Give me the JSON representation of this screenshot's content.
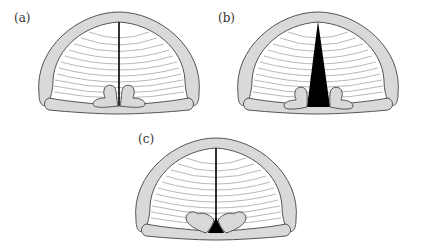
{
  "figure": {
    "panels": [
      {
        "id": "a",
        "label": "(a)",
        "description": "Glottis closed: vocal folds adducted, thin line at midline, arytenoids together"
      },
      {
        "id": "b",
        "label": "(b)",
        "description": "Glottis open: vocal folds abducted, wide triangular opening, arytenoids apart"
      },
      {
        "id": "c",
        "label": "(c)",
        "description": "Whisper: vocal folds adducted anteriorly with small triangular opening between arytenoids"
      }
    ]
  },
  "colors": {
    "cartilage_fill": "#d9d9d9",
    "outline": "#555555",
    "fold_lines": "#999999",
    "glottis": "#000000",
    "background": "#ffffff"
  }
}
